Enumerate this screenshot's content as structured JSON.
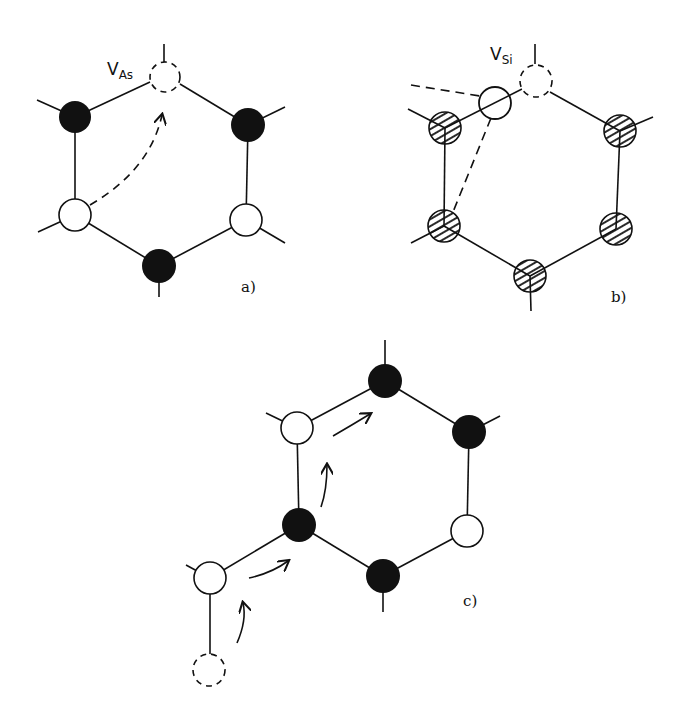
{
  "diagram": {
    "panels": [
      {
        "id": "a",
        "label": "a)",
        "vacancy_label": {
          "main": "V",
          "sub": "As"
        },
        "atoms": [
          {
            "type": "vacancy",
            "x": 165,
            "y": 77
          },
          {
            "type": "filled",
            "x": 75,
            "y": 117
          },
          {
            "type": "filled",
            "x": 248,
            "y": 125
          },
          {
            "type": "open",
            "x": 75,
            "y": 215
          },
          {
            "type": "open",
            "x": 246,
            "y": 220
          },
          {
            "type": "filled",
            "x": 159,
            "y": 266
          }
        ],
        "arrows": [
          {
            "style": "dashed",
            "from": "open lower-left",
            "to": "vacancy"
          }
        ]
      },
      {
        "id": "b",
        "label": "b)",
        "vacancy_label": {
          "main": "V",
          "sub": "Si"
        },
        "atoms": [
          {
            "type": "vacancy",
            "x": 536,
            "y": 81
          },
          {
            "type": "interstitial-open",
            "x": 495,
            "y": 103
          },
          {
            "type": "hatched",
            "x": 445,
            "y": 128
          },
          {
            "type": "hatched",
            "x": 620,
            "y": 131
          },
          {
            "type": "hatched",
            "x": 444,
            "y": 226
          },
          {
            "type": "hatched",
            "x": 616,
            "y": 229
          },
          {
            "type": "hatched",
            "x": 530,
            "y": 276
          }
        ],
        "arrows": [
          {
            "style": "dashed-lines",
            "from": "interstitial",
            "to": "neighbors"
          }
        ]
      },
      {
        "id": "c",
        "label": "c)",
        "atoms": [
          {
            "type": "filled",
            "x": 385,
            "y": 381
          },
          {
            "type": "open",
            "x": 297,
            "y": 428
          },
          {
            "type": "filled",
            "x": 469,
            "y": 432
          },
          {
            "type": "filled",
            "x": 299,
            "y": 525
          },
          {
            "type": "open",
            "x": 467,
            "y": 531
          },
          {
            "type": "filled",
            "x": 383,
            "y": 576
          },
          {
            "type": "open",
            "x": 210,
            "y": 578
          },
          {
            "type": "vacancy",
            "x": 209,
            "y": 670
          }
        ],
        "arrows": [
          {
            "style": "solid-curved",
            "step": 1
          },
          {
            "style": "solid-curved",
            "step": 2
          },
          {
            "style": "solid-curved",
            "step": 3
          },
          {
            "style": "solid-curved",
            "step": 4
          }
        ]
      }
    ]
  }
}
